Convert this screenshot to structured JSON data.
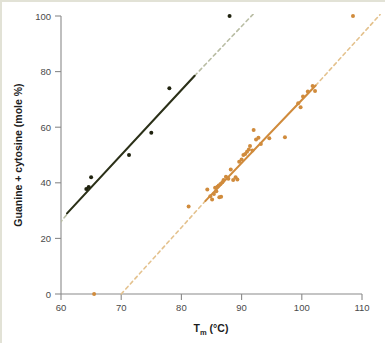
{
  "figure": {
    "name": "tm-vs-gc-content-scatter"
  },
  "chart_data": {
    "type": "scatter",
    "title": "",
    "subtitle": "",
    "xlabel_main": "T",
    "xlabel_sub": "m",
    "xlabel_unit": " (°C)",
    "xlabel": "Tm (°C)",
    "ylabel": "Guanine + cytosine (mole %)",
    "xlim": [
      60,
      110
    ],
    "ylim": [
      0,
      100
    ],
    "xticks": [
      60,
      70,
      80,
      90,
      100,
      110
    ],
    "xtick_labels": [
      "60",
      "70",
      "80",
      "90",
      "100",
      "110"
    ],
    "yticks": [
      0,
      20,
      40,
      60,
      80,
      100
    ],
    "ytick_labels": [
      "0",
      "20",
      "40",
      "60",
      "80",
      "100"
    ],
    "grid": false,
    "legend": "none",
    "colors": {
      "series_dark": "#20230f",
      "series_dark_line": "#2b3018",
      "series_dark_dashed": "#b9bda4",
      "series_orange": "#d08b3c",
      "series_orange_dashed": "#e4c28e",
      "axis": "#8a8a8a",
      "background": "#ffffff",
      "frame": "#e2e2d6"
    },
    "series": [
      {
        "name": "low-salt-dna",
        "color": "#20230f",
        "marker": "filled-circle",
        "points": [
          [
            64.2,
            37.8
          ],
          [
            64.6,
            38.5
          ],
          [
            65.0,
            42.0
          ],
          [
            71.3,
            50.0
          ],
          [
            75.0,
            58.0
          ],
          [
            78.0,
            74.0
          ],
          [
            88.0,
            100.0
          ]
        ],
        "fit_line": {
          "style": "solid",
          "x_start": 61.0,
          "y_start": 29.0,
          "x_end": 82.2,
          "y_end": 78.5
        },
        "extension_line": {
          "style": "dashed",
          "color": "#b9bda4",
          "segments": [
            {
              "x_start": 59.8,
              "y_start": 25.5,
              "x_end": 61.2,
              "y_end": 29.2
            },
            {
              "x_start": 82.2,
              "y_start": 78.5,
              "x_end": 92.5,
              "y_end": 102.0
            }
          ]
        }
      },
      {
        "name": "high-salt-dna",
        "color": "#d08b3c",
        "marker": "filled-circle",
        "points": [
          [
            65.5,
            0.0
          ],
          [
            81.2,
            31.5
          ],
          [
            84.3,
            37.6
          ],
          [
            84.8,
            35.2
          ],
          [
            85.1,
            34.0
          ],
          [
            85.4,
            36.0
          ],
          [
            85.6,
            38.2
          ],
          [
            85.8,
            37.0
          ],
          [
            86.0,
            38.6
          ],
          [
            86.2,
            39.0
          ],
          [
            86.3,
            34.8
          ],
          [
            86.5,
            39.6
          ],
          [
            86.6,
            35.0
          ],
          [
            86.8,
            40.2
          ],
          [
            87.0,
            41.0
          ],
          [
            87.4,
            42.2
          ],
          [
            87.8,
            41.5
          ],
          [
            88.2,
            44.8
          ],
          [
            88.6,
            41.0
          ],
          [
            89.0,
            42.0
          ],
          [
            89.3,
            41.2
          ],
          [
            89.6,
            47.6
          ],
          [
            90.0,
            48.4
          ],
          [
            90.3,
            50.0
          ],
          [
            90.6,
            50.4
          ],
          [
            90.9,
            51.2
          ],
          [
            91.2,
            52.0
          ],
          [
            91.4,
            53.2
          ],
          [
            91.8,
            51.6
          ],
          [
            92.0,
            59.0
          ],
          [
            92.4,
            55.6
          ],
          [
            92.8,
            56.2
          ],
          [
            93.2,
            54.0
          ],
          [
            94.6,
            56.0
          ],
          [
            97.2,
            56.4
          ],
          [
            99.4,
            68.6
          ],
          [
            99.8,
            67.2
          ],
          [
            100.2,
            71.0
          ],
          [
            101.0,
            72.8
          ],
          [
            101.8,
            74.8
          ],
          [
            102.2,
            73.0
          ],
          [
            108.5,
            100.0
          ]
        ],
        "fit_line": {
          "style": "solid",
          "x_start": 84.0,
          "y_start": 33.5,
          "x_end": 102.3,
          "y_end": 75.0
        },
        "extension_line": {
          "style": "dashed",
          "color": "#e4c28e",
          "segments": [
            {
              "x_start": 70.0,
              "y_start": 0.0,
              "x_end": 84.0,
              "y_end": 33.5
            },
            {
              "x_start": 102.3,
              "y_start": 75.0,
              "x_end": 113.0,
              "y_end": 100.5
            }
          ]
        }
      }
    ]
  }
}
